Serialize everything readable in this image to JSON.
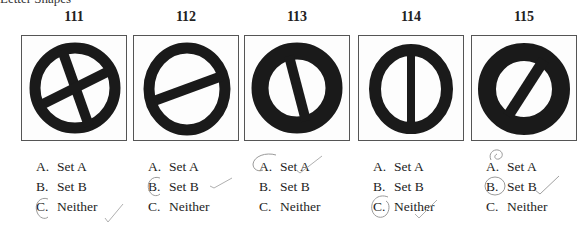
{
  "header": {
    "cut_title": "Letter Shapes"
  },
  "questions": [
    {
      "number": "111",
      "shape": "circle with X cross",
      "options": [
        {
          "letter": "A.",
          "text": "Set A"
        },
        {
          "letter": "B.",
          "text": "Set B"
        },
        {
          "letter": "C.",
          "text": "Neither"
        }
      ],
      "circled": "C",
      "checkmark": true
    },
    {
      "number": "112",
      "shape": "ellipse with diagonal bar",
      "options": [
        {
          "letter": "A.",
          "text": "Set A"
        },
        {
          "letter": "B.",
          "text": "Set B"
        },
        {
          "letter": "C.",
          "text": "Neither"
        }
      ],
      "circled": "B",
      "checkmark": true
    },
    {
      "number": "113",
      "shape": "thick circle with steep diagonal bar",
      "options": [
        {
          "letter": "A.",
          "text": "Set A"
        },
        {
          "letter": "B.",
          "text": "Set B"
        },
        {
          "letter": "C.",
          "text": "Neither"
        }
      ],
      "circled": "A",
      "checkmark": true
    },
    {
      "number": "114",
      "shape": "circle with vertical bar",
      "options": [
        {
          "letter": "A.",
          "text": "Set A"
        },
        {
          "letter": "B.",
          "text": "Set B"
        },
        {
          "letter": "C.",
          "text": "Neither"
        }
      ],
      "circled": "C",
      "checkmark": true
    },
    {
      "number": "115",
      "shape": "thick circle with diagonal slash",
      "options": [
        {
          "letter": "A.",
          "text": "Set A"
        },
        {
          "letter": "B.",
          "text": "Set B"
        },
        {
          "letter": "C.",
          "text": "Neither"
        }
      ],
      "circled": "B",
      "checkmark": true
    }
  ],
  "colors": {
    "ink": "#1a1a1a",
    "pencil": "#9a9a9a",
    "border": "#555555"
  }
}
